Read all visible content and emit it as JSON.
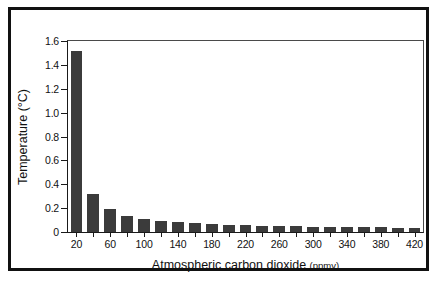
{
  "chart_data": {
    "type": "bar",
    "title": "",
    "xlabel": "Atmospheric carbon dioxide",
    "xlabel_units": "(ppmv)",
    "ylabel": "Temperature (°C)",
    "xlim": [
      10,
      430
    ],
    "ylim": [
      0,
      1.6
    ],
    "grid": false,
    "legend": null,
    "bar_color": "#3b3b3b",
    "axis_color": "#1a1a1a",
    "background": "#ffffff",
    "categories": [
      20,
      40,
      60,
      80,
      100,
      120,
      140,
      160,
      180,
      200,
      220,
      240,
      260,
      280,
      300,
      320,
      340,
      360,
      380,
      400,
      420
    ],
    "values": [
      1.52,
      0.32,
      0.19,
      0.135,
      0.105,
      0.09,
      0.08,
      0.075,
      0.065,
      0.06,
      0.055,
      0.052,
      0.05,
      0.048,
      0.046,
      0.044,
      0.043,
      0.04,
      0.038,
      0.037,
      0.036
    ],
    "xticks": [
      20,
      40,
      60,
      80,
      100,
      120,
      140,
      160,
      180,
      200,
      220,
      240,
      260,
      280,
      300,
      320,
      340,
      360,
      380,
      400,
      420
    ],
    "xtick_labels": [
      "20",
      "",
      "60",
      "",
      "100",
      "",
      "140",
      "",
      "180",
      "",
      "220",
      "",
      "260",
      "",
      "300",
      "",
      "340",
      "",
      "380",
      "",
      "420"
    ],
    "yticks": [
      0,
      0.2,
      0.4,
      0.6,
      0.8,
      1.0,
      1.2,
      1.4,
      1.6
    ],
    "ytick_labels": [
      "0",
      "0.2",
      "0.4",
      "0.6",
      "0.8",
      "1.0",
      "1.2",
      "1.4",
      "1.6"
    ]
  }
}
